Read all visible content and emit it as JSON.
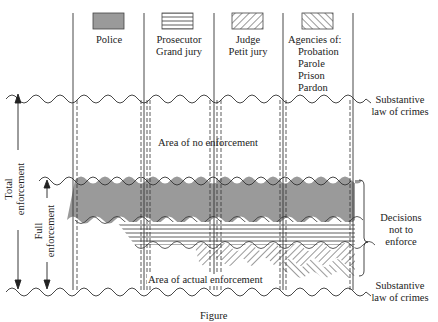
{
  "diagram": {
    "agencies": [
      {
        "name": "police",
        "label_lines": [
          "Police"
        ],
        "pattern": "solid-gray",
        "color": "#9a9a9a"
      },
      {
        "name": "prosecutor",
        "label_lines": [
          "Prosecutor",
          "Grand jury"
        ],
        "pattern": "horizontal-lines"
      },
      {
        "name": "judge",
        "label_lines": [
          "Judge",
          "Petit jury"
        ],
        "pattern": "diagonal-backslash"
      },
      {
        "name": "agencies",
        "label_lines": [
          "Agencies of:",
          "Probation",
          "Parole",
          "Prison",
          "Pardon"
        ],
        "pattern": "diagonal-slash"
      }
    ],
    "right_labels": {
      "top": [
        "Substantive",
        "law of crimes"
      ],
      "bracket": [
        "Decisions",
        "not to",
        "enforce"
      ],
      "bottom": [
        "Substantive",
        "law of crimes"
      ]
    },
    "left_labels": {
      "total": [
        "Total",
        "enforcement"
      ],
      "full": [
        "Full",
        "enforcement"
      ]
    },
    "areas": {
      "no_enforcement": "Area of no enforcement",
      "actual_enforcement": "Area of actual enforcement"
    },
    "caption": "Figure"
  }
}
